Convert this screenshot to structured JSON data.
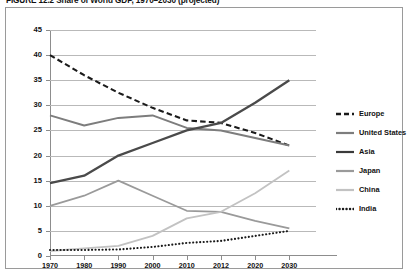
{
  "figure": {
    "number": "FIGURE 12.2",
    "title": "Share of World GDP, 1970–2030 (projected)",
    "full_title": "FIGURE 12.2  Share of World GDP, 1970–2030 (projected)"
  },
  "chart_data": {
    "type": "line",
    "title": "Share of World GDP, 1970–2030 (projected)",
    "xlabel": "",
    "ylabel": "",
    "x": [
      1970,
      1980,
      1990,
      2000,
      2010,
      2012,
      2020,
      2030
    ],
    "xtick_labels": [
      "1970",
      "1980",
      "1990",
      "2000",
      "2010",
      "2012",
      "2020",
      "2030"
    ],
    "ytick_labels": [
      "0",
      "5",
      "10",
      "15",
      "20",
      "25",
      "30",
      "35",
      "40",
      "45"
    ],
    "yticks": [
      0,
      5,
      10,
      15,
      20,
      25,
      30,
      35,
      40,
      45
    ],
    "ylim": [
      0,
      45
    ],
    "grid": true,
    "legend_position": "right",
    "series": [
      {
        "name": "Europe",
        "style": "dashed",
        "color": "#1a1a1a",
        "width": 2.1,
        "values": [
          40,
          36,
          32.5,
          29.5,
          27,
          26.5,
          24.5,
          22
        ]
      },
      {
        "name": "United States",
        "style": "solid",
        "color": "#7d7d7d",
        "width": 2.0,
        "values": [
          28,
          26,
          27.5,
          28,
          25.5,
          25,
          23.5,
          22
        ]
      },
      {
        "name": "Asia",
        "style": "solid",
        "color": "#4a4a4a",
        "width": 2.3,
        "values": [
          14.5,
          16,
          20,
          22.5,
          25,
          26.5,
          30.5,
          35
        ]
      },
      {
        "name": "Japan",
        "style": "solid",
        "color": "#9a9a9a",
        "width": 1.8,
        "values": [
          10,
          12,
          15,
          12,
          9,
          8.8,
          7,
          5.5
        ]
      },
      {
        "name": "China",
        "style": "solid",
        "color": "#c2c2c2",
        "width": 1.8,
        "values": [
          1,
          1.5,
          2,
          4,
          7.5,
          8.8,
          12.5,
          17
        ]
      },
      {
        "name": "India",
        "style": "dotted",
        "color": "#1a1a1a",
        "width": 2.1,
        "values": [
          1.2,
          1.2,
          1.3,
          1.8,
          2.6,
          3.0,
          4.0,
          5.0
        ]
      }
    ]
  },
  "legend": {
    "items": [
      {
        "label": "Europe",
        "style": "dashed",
        "color": "#1a1a1a"
      },
      {
        "label": "United States",
        "style": "solid",
        "color": "#7d7d7d"
      },
      {
        "label": "Asia",
        "style": "solid",
        "color": "#3a3a3a"
      },
      {
        "label": "Japan",
        "style": "solid",
        "color": "#9a9a9a"
      },
      {
        "label": "China",
        "style": "solid",
        "color": "#c2c2c2"
      },
      {
        "label": "India",
        "style": "dotted",
        "color": "#1a1a1a"
      }
    ]
  },
  "colors": {
    "grid": "#b9b9b9",
    "axis": "#8d8d8d",
    "frame": "#9a9a9a",
    "text": "#111111",
    "background": "#ffffff"
  }
}
